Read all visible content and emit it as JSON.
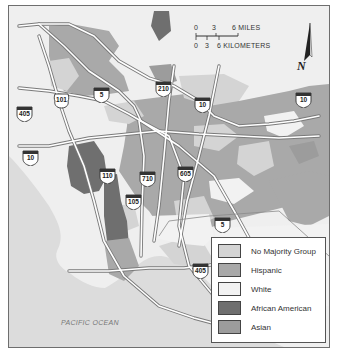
{
  "map": {
    "title": "Los Angeles Area Majority Racial/Ethnic Groups",
    "scale_bar": {
      "miles_ticks": [
        "0",
        "3",
        "6 MILES"
      ],
      "km_ticks": [
        "0",
        "3",
        "6 KILOMETERS"
      ]
    },
    "north_arrow": {
      "label": "N"
    },
    "water_label": "PACIFIC OCEAN",
    "highways": [
      {
        "id": "I-210",
        "label": "210",
        "type": "interstate"
      },
      {
        "id": "I-5-north",
        "label": "5",
        "type": "interstate"
      },
      {
        "id": "US-101",
        "label": "101",
        "type": "us"
      },
      {
        "id": "I-405-north",
        "label": "405",
        "type": "interstate"
      },
      {
        "id": "I-10-west",
        "label": "10",
        "type": "interstate"
      },
      {
        "id": "I-10-central",
        "label": "10",
        "type": "interstate"
      },
      {
        "id": "I-10-east",
        "label": "10",
        "type": "interstate"
      },
      {
        "id": "I-110",
        "label": "110",
        "type": "interstate"
      },
      {
        "id": "I-710",
        "label": "710",
        "type": "interstate"
      },
      {
        "id": "I-605",
        "label": "605",
        "type": "interstate"
      },
      {
        "id": "I-105",
        "label": "105",
        "type": "interstate"
      },
      {
        "id": "I-5-south",
        "label": "5",
        "type": "interstate"
      },
      {
        "id": "I-405-south",
        "label": "405",
        "type": "interstate"
      }
    ],
    "legend": [
      {
        "label": "No Majority Group",
        "color": "#d4d4d4"
      },
      {
        "label": "Hispanic",
        "color": "#a9a9a9"
      },
      {
        "label": "White",
        "color": "#f2f2f2"
      },
      {
        "label": "African American",
        "color": "#6f6f6f"
      },
      {
        "label": "Asian",
        "color": "#9c9c9c"
      }
    ],
    "colors": {
      "background": "#efefef",
      "ocean": "#dcdcdc",
      "road": "#ffffff",
      "road_outline": "#7a7a7a",
      "border": "#6e6e6e"
    }
  }
}
